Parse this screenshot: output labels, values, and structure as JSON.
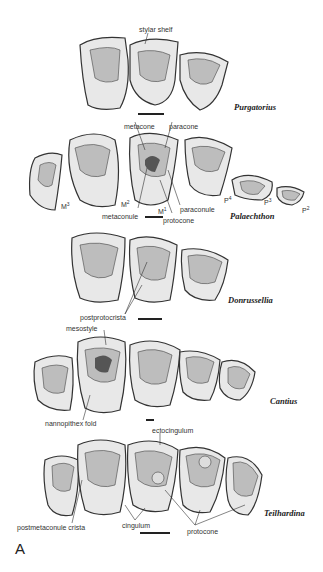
{
  "figure": {
    "panel_label": "A",
    "rows": [
      {
        "taxon": "Purgatorius",
        "labels": [
          "stylar shelf"
        ]
      },
      {
        "taxon": "Palaechthon",
        "labels": [
          "metacone",
          "paracone",
          "paraconule",
          "metaconule",
          "protocone"
        ],
        "tooth_labels": [
          "M3",
          "M2",
          "M1",
          "P4",
          "P3",
          "P2"
        ]
      },
      {
        "taxon": "Donrussellia",
        "labels": [
          "postprotocrista"
        ]
      },
      {
        "taxon": "Cantius",
        "labels": [
          "mesostyle",
          "nannopithex fold"
        ]
      },
      {
        "taxon": "Teilhardina",
        "labels": [
          "ectocingulum",
          "postmetaconule crista",
          "cingulum",
          "protocone"
        ]
      }
    ]
  },
  "tooth_sup": {
    "M3": "M",
    "M3s": "3",
    "M2": "M",
    "M2s": "2",
    "M1": "M",
    "M1s": "1",
    "P4": "P",
    "P4s": "4",
    "P3": "P",
    "P3s": "3",
    "P2": "P",
    "P2s": "2"
  }
}
